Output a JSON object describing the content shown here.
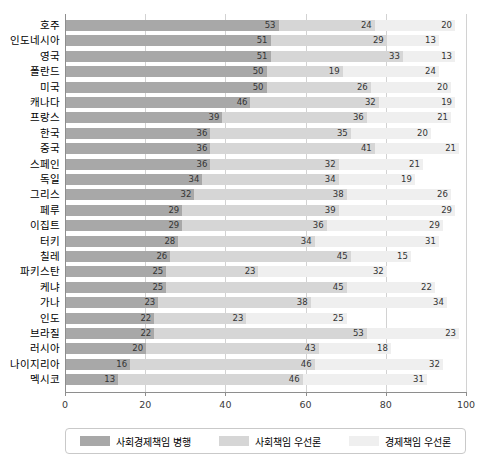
{
  "chart_data": {
    "type": "bar",
    "orientation": "horizontal",
    "stacked": true,
    "title": "",
    "subtitle": "",
    "xlabel": "",
    "ylabel": "",
    "xlim": [
      0,
      100
    ],
    "xticks": [
      0,
      20,
      40,
      60,
      80,
      100
    ],
    "xtick_labels": [
      "0",
      "20",
      "40",
      "60",
      "80",
      "100"
    ],
    "grid": "vertical",
    "legend_position": "bottom",
    "categories": [
      "호주",
      "인도네시아",
      "영국",
      "폴란드",
      "미국",
      "캐나다",
      "프랑스",
      "한국",
      "중국",
      "스페인",
      "독일",
      "그리스",
      "페루",
      "이집트",
      "터키",
      "칠레",
      "파키스탄",
      "케냐",
      "가나",
      "인도",
      "브라질",
      "러시아",
      "나이지리아",
      "멕시코"
    ],
    "series": [
      {
        "name": "사회경제책임 병행",
        "color": "#a8a8a8",
        "values": [
          53,
          51,
          51,
          50,
          50,
          46,
          39,
          36,
          36,
          36,
          34,
          32,
          29,
          29,
          28,
          26,
          25,
          25,
          23,
          22,
          22,
          20,
          16,
          13
        ]
      },
      {
        "name": "사회책임 우선론",
        "color": "#d6d6d6",
        "values": [
          24,
          29,
          33,
          19,
          26,
          32,
          36,
          35,
          41,
          32,
          34,
          38,
          39,
          36,
          34,
          45,
          23,
          45,
          38,
          23,
          53,
          43,
          46,
          46
        ]
      },
      {
        "name": "경제책임 우선론",
        "color": "#efefef",
        "values": [
          20,
          13,
          13,
          24,
          20,
          19,
          21,
          20,
          21,
          21,
          19,
          26,
          29,
          29,
          31,
          15,
          32,
          22,
          34,
          25,
          23,
          18,
          32,
          31
        ]
      }
    ]
  },
  "legend": {
    "items": [
      {
        "label": "사회경제책임 병행",
        "color": "#a8a8a8"
      },
      {
        "label": "사회책임 우선론",
        "color": "#d6d6d6"
      },
      {
        "label": "경제책임 우선론",
        "color": "#efefef"
      }
    ]
  }
}
